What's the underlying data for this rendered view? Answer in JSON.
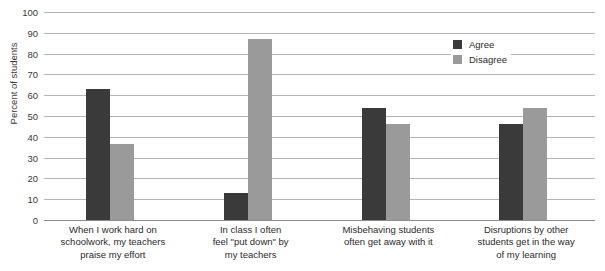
{
  "chart_data": {
    "type": "bar",
    "title": "",
    "xlabel": "",
    "ylabel": "Percent of students",
    "ylim": [
      0,
      100
    ],
    "ytick_step": 10,
    "yticks": [
      100,
      90,
      80,
      70,
      60,
      50,
      40,
      30,
      20,
      10,
      0
    ],
    "grid": true,
    "legend_position": "top-right-inside",
    "categories": [
      "When I work hard on schoolwork, my teachers praise my effort",
      "In class I often feel \"put down\" by my teachers",
      "Misbehaving students often get away with it",
      "Disruptions by other students get in the way of my learning"
    ],
    "category_lines": [
      [
        "When I work hard on",
        "schoolwork, my teachers",
        "praise my effort"
      ],
      [
        "In class I often",
        "feel \"put down\" by",
        "my teachers"
      ],
      [
        "Misbehaving students",
        "often get away with it"
      ],
      [
        "Disruptions by other",
        "students get in the way",
        "of my learning"
      ]
    ],
    "series": [
      {
        "name": "Agree",
        "color": "#3a3a3a",
        "values": [
          63,
          13,
          54,
          46
        ]
      },
      {
        "name": "Disagree",
        "color": "#9a9a9a",
        "values": [
          36.5,
          87,
          46,
          54
        ]
      }
    ]
  },
  "legend": {
    "agree_label": "Agree",
    "disagree_label": "Disagree"
  },
  "axis": {
    "y_title": "Percent of students"
  }
}
